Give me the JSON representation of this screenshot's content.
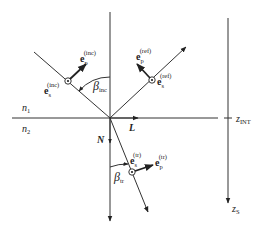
{
  "diagram": {
    "media": {
      "upper": "n",
      "upper_sub": "1",
      "lower": "n",
      "lower_sub": "2"
    },
    "axis": {
      "interface_label": "z",
      "interface_sub": "INT",
      "source_label": "z",
      "source_sub": "S"
    },
    "vectors": {
      "L": "L",
      "N": "N",
      "incident_p": {
        "base": "e",
        "sub": "p",
        "sup": "(inc)"
      },
      "incident_s": {
        "base": "e",
        "sub": "s",
        "sup": "(inc)"
      },
      "reflected_p": {
        "base": "e",
        "sub": "p",
        "sup": "(ref)"
      },
      "reflected_s": {
        "base": "e",
        "sub": "s",
        "sup": "(ref)"
      },
      "transmitted_p": {
        "base": "e",
        "sub": "p",
        "sup": "(tr)"
      },
      "transmitted_s": {
        "base": "e",
        "sub": "s",
        "sup": "(tr)"
      }
    },
    "angles": {
      "incidence": {
        "symbol": "β",
        "sub": "inc"
      },
      "transmission": {
        "symbol": "β",
        "sub": "tr"
      }
    }
  }
}
